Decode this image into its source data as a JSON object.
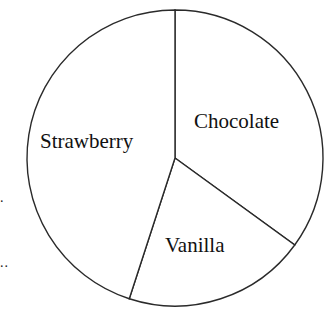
{
  "chart_data": {
    "type": "pie",
    "title": "",
    "start_angle_deg": 90,
    "direction": "clockwise",
    "slices": [
      {
        "label": "Chocolate",
        "value": 35
      },
      {
        "label": "Vanilla",
        "value": 20
      },
      {
        "label": "Strawberry",
        "value": 45
      }
    ],
    "labels_inside": true,
    "legend": "none"
  },
  "margin_marks": [
    ".",
    ".."
  ]
}
